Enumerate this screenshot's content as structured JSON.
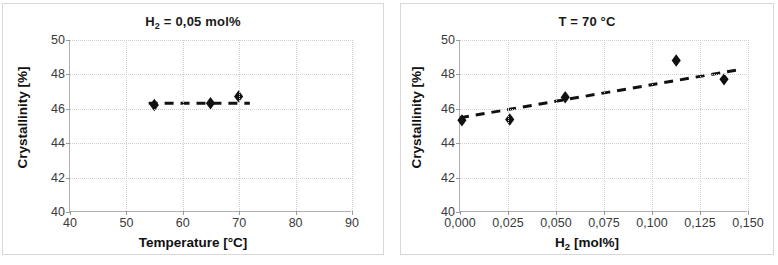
{
  "figure": {
    "panels": [
      {
        "name": "crystallinity-vs-temperature",
        "title_main": "H",
        "title_sub": "2",
        "title_rest": " = 0,05 mol%"
      },
      {
        "name": "crystallinity-vs-hydrogen",
        "title_main": "T = 70 °C",
        "title_sub": "",
        "title_rest": ""
      }
    ],
    "axis_labels": {
      "x_left_main": "Temperature [°C]",
      "x_right_main": "H",
      "x_right_sub": "2",
      "x_right_rest": " [mol%]",
      "y_main": "Crystallinity [%]"
    }
  },
  "chart_data": [
    {
      "type": "scatter",
      "title": "H2 = 0,05 mol%",
      "xlabel": "Temperature [°C]",
      "ylabel": "Crystallinity [%]",
      "xlim": [
        40,
        90
      ],
      "ylim": [
        40,
        50
      ],
      "xticks": [
        40,
        50,
        60,
        70,
        80,
        90
      ],
      "xtick_labels": [
        "40",
        "50",
        "60",
        "70",
        "80",
        "90"
      ],
      "yticks": [
        40,
        42,
        44,
        46,
        48,
        50
      ],
      "ytick_labels": [
        "40",
        "42",
        "44",
        "46",
        "48",
        "50"
      ],
      "grid": true,
      "legend": "none",
      "marker": "diamond",
      "marker_color": "#111111",
      "trendline": {
        "style": "dashed",
        "color": "#111111",
        "x_start": 54.0,
        "y_start": 46.3,
        "x_end": 72.0,
        "y_end": 46.3
      },
      "x": [
        55,
        65,
        70
      ],
      "y": [
        46.2,
        46.3,
        46.7
      ]
    },
    {
      "type": "scatter",
      "title": "T = 70 °C",
      "xlabel": "H2 [mol%]",
      "ylabel": "Crystallinity [%]",
      "xlim": [
        0.0,
        0.15
      ],
      "ylim": [
        40,
        50
      ],
      "xticks": [
        0.0,
        0.025,
        0.05,
        0.075,
        0.1,
        0.125,
        0.15
      ],
      "xtick_labels": [
        "0,000",
        "0,025",
        "0,050",
        "0,075",
        "0,100",
        "0,125",
        "0,150"
      ],
      "yticks": [
        40,
        42,
        44,
        46,
        48,
        50
      ],
      "ytick_labels": [
        "40",
        "42",
        "44",
        "46",
        "48",
        "50"
      ],
      "grid": true,
      "legend": "none",
      "marker": "diamond",
      "marker_color": "#111111",
      "trendline": {
        "style": "dashed",
        "color": "#111111",
        "x_start": 0.0,
        "y_start": 45.45,
        "x_end": 0.145,
        "y_end": 48.25
      },
      "x": [
        0.001,
        0.026,
        0.055,
        0.113,
        0.138
      ],
      "y": [
        45.3,
        45.35,
        46.65,
        48.8,
        47.7
      ]
    }
  ]
}
